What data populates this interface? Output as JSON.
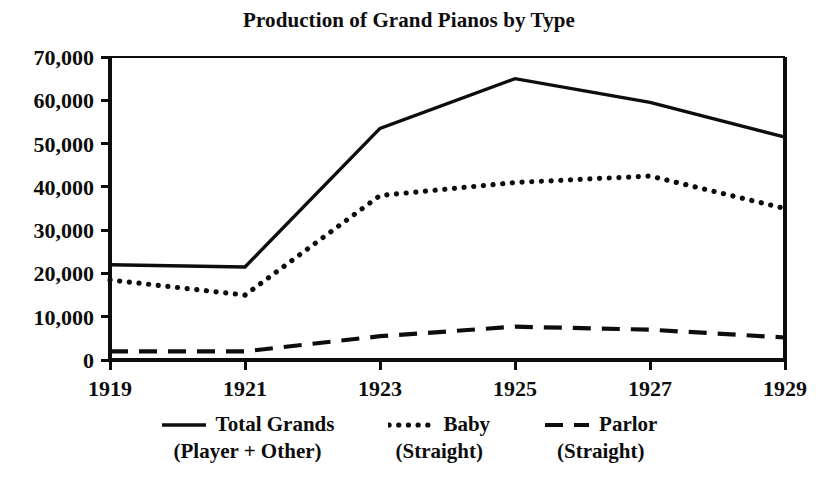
{
  "chart_data": {
    "type": "line",
    "title": "Production of Grand Pianos by Type",
    "xlabel": "",
    "ylabel": "",
    "x": [
      1919,
      1920,
      1921,
      1922,
      1923,
      1924,
      1925,
      1926,
      1927,
      1928,
      1929
    ],
    "xtick_labels": [
      "1919",
      "1921",
      "1923",
      "1925",
      "1927",
      "1929"
    ],
    "xticks": [
      1919,
      1921,
      1923,
      1925,
      1927,
      1929
    ],
    "xlim": [
      1919,
      1929
    ],
    "ytick_labels": [
      "0",
      "10,000",
      "20,000",
      "30,000",
      "40,000",
      "50,000",
      "60,000",
      "70,000"
    ],
    "yticks": [
      0,
      10000,
      20000,
      30000,
      40000,
      50000,
      60000,
      70000
    ],
    "ylim": [
      0,
      70000
    ],
    "grid": false,
    "legend_position": "below",
    "series": [
      {
        "name": "Total Grands",
        "sublabel": "(Player + Other)",
        "style": "solid",
        "x": [
          1919,
          1921,
          1923,
          1925,
          1927,
          1929
        ],
        "values": [
          22000,
          21500,
          53500,
          65000,
          59500,
          51500
        ]
      },
      {
        "name": "Baby",
        "sublabel": "(Straight)",
        "style": "dotted",
        "x": [
          1919,
          1921,
          1923,
          1925,
          1927,
          1929
        ],
        "values": [
          18500,
          15000,
          38000,
          41000,
          42500,
          35000
        ]
      },
      {
        "name": "Parlor",
        "sublabel": "(Straight)",
        "style": "dashed",
        "x": [
          1919,
          1921,
          1923,
          1925,
          1927,
          1929
        ],
        "values": [
          2000,
          2000,
          5500,
          7700,
          7000,
          5200
        ]
      }
    ]
  },
  "legend": {
    "items": [
      {
        "label": "Total Grands",
        "sublabel": "(Player + Other)",
        "style": "solid"
      },
      {
        "label": "Baby",
        "sublabel": "(Straight)",
        "style": "dotted"
      },
      {
        "label": "Parlor",
        "sublabel": "(Straight)",
        "style": "dashed"
      }
    ]
  },
  "colors": {
    "ink": "#0d0d0d",
    "background": "#ffffff"
  }
}
